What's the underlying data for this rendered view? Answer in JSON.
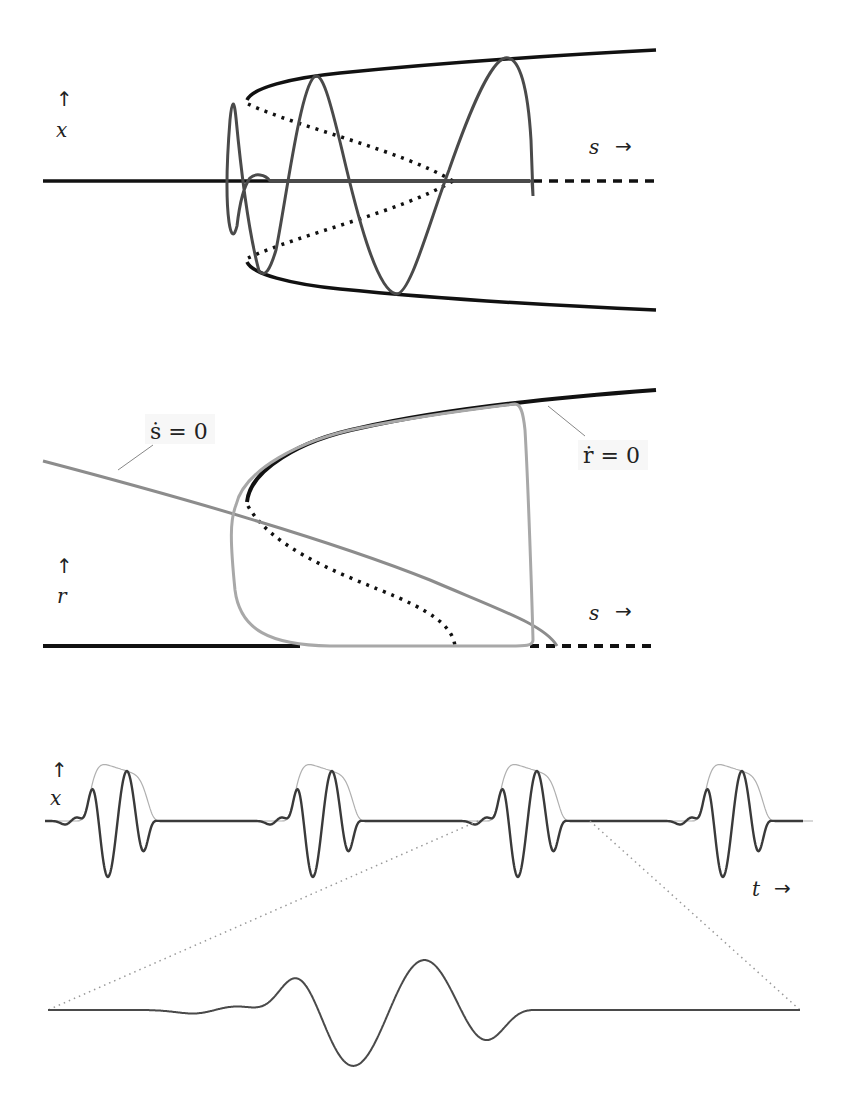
{
  "figure": {
    "panels": [
      {
        "id": "top",
        "y_label": "x",
        "x_label": "s",
        "y_arrow": "↑",
        "x_arrow": "→",
        "description": "Bifurcation diagram in (s,x) with stable/unstable branches and a spiraling trajectory"
      },
      {
        "id": "middle",
        "y_label": "r",
        "x_label": "s",
        "y_arrow": "↑",
        "x_arrow": "→",
        "annotations": [
          {
            "text": "ṡ = 0",
            "target": "s-nullcline"
          },
          {
            "text": "ṙ = 0",
            "target": "r-nullcline"
          }
        ],
        "description": "Phase plane (s,r) with nullclines and a relaxation limit cycle"
      },
      {
        "id": "bottom",
        "y_label": "x",
        "x_label": "t",
        "y_arrow": "↑",
        "x_arrow": "→",
        "description": "Time series x(t) with 4 bursts, envelope in light gray, and a magnified single burst below"
      }
    ]
  },
  "chart_data": [
    {
      "type": "line",
      "title": "",
      "xlabel": "s",
      "ylabel": "x",
      "series": [
        {
          "name": "x=0 stable branch",
          "style": "solid-black",
          "x": [
            0,
            0.8
          ],
          "y": [
            0,
            0
          ]
        },
        {
          "name": "x=0 unstable branch",
          "style": "dashed-black",
          "x": [
            0.8,
            1.0
          ],
          "y": [
            0,
            0
          ]
        },
        {
          "name": "upper stable branch",
          "style": "solid-black",
          "x": [
            0.33,
            0.4,
            0.6,
            0.8,
            1.0
          ],
          "y": [
            0.62,
            0.72,
            0.82,
            0.88,
            0.93
          ]
        },
        {
          "name": "lower stable branch",
          "style": "solid-black",
          "x": [
            0.33,
            0.4,
            0.6,
            0.8,
            1.0
          ],
          "y": [
            -0.62,
            -0.72,
            -0.82,
            -0.88,
            -0.93
          ]
        },
        {
          "name": "upper unstable branch",
          "style": "dotted-black",
          "x": [
            0.33,
            0.5,
            0.67
          ],
          "y": [
            0.58,
            0.3,
            0
          ]
        },
        {
          "name": "lower unstable branch",
          "style": "dotted-black",
          "x": [
            0.33,
            0.5,
            0.67
          ],
          "y": [
            -0.58,
            -0.3,
            0
          ]
        },
        {
          "name": "trajectory",
          "style": "solid-gray",
          "note": "spiral oscillation growing in s then collapsing"
        }
      ]
    },
    {
      "type": "line",
      "title": "",
      "xlabel": "s",
      "ylabel": "r",
      "series": [
        {
          "name": "r=0 stable",
          "style": "solid-black",
          "x": [
            0,
            0.8
          ],
          "y": [
            0,
            0
          ]
        },
        {
          "name": "r=0 unstable",
          "style": "dashed-black",
          "x": [
            0.8,
            1.0
          ],
          "y": [
            0,
            0
          ]
        },
        {
          "name": "upper stable branch (ṙ=0)",
          "style": "solid-black",
          "x": [
            0.33,
            0.5,
            0.8,
            1.0
          ],
          "y": [
            0.57,
            0.8,
            0.94,
            1.0
          ]
        },
        {
          "name": "unstable branch",
          "style": "dotted-black",
          "x": [
            0.33,
            0.5,
            0.67
          ],
          "y": [
            0.55,
            0.3,
            0
          ]
        },
        {
          "name": "s-nullcline (ṡ=0)",
          "style": "solid-gray",
          "x": [
            0,
            0.4,
            0.7,
            0.83
          ],
          "y": [
            0.7,
            0.5,
            0.25,
            0
          ]
        },
        {
          "name": "limit cycle",
          "style": "solid-lightgray",
          "note": "relaxation loop, s in [0.31,0.81], r in [0,0.95]"
        }
      ]
    },
    {
      "type": "line",
      "title": "",
      "xlabel": "t",
      "ylabel": "x",
      "series": [
        {
          "name": "x(t)",
          "style": "solid-darkgray",
          "bursts": 4,
          "spikes_per_burst": 3
        },
        {
          "name": "envelope",
          "style": "thin-lightgray"
        },
        {
          "name": "magnified burst",
          "style": "solid-darkgray",
          "peaks": [
            1.0,
            0.85,
            0.62
          ],
          "troughs": [
            -0.95,
            -0.8
          ]
        }
      ]
    }
  ]
}
